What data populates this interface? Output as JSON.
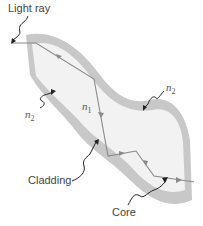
{
  "diagram": {
    "type": "optical-fiber-total-internal-reflection",
    "labels": {
      "light_ray": "Light ray",
      "n1": "n",
      "n1_sub": "1",
      "n2_top": "n",
      "n2_top_sub": "2",
      "n2_left": "n",
      "n2_left_sub": "2",
      "cladding": "Cladding",
      "core": "Core"
    },
    "colors": {
      "cladding": "#c8c8c8",
      "core": "#f2f2f2",
      "ray": "#8a8a8a",
      "pointer": "#222222",
      "text": "#444444"
    }
  }
}
